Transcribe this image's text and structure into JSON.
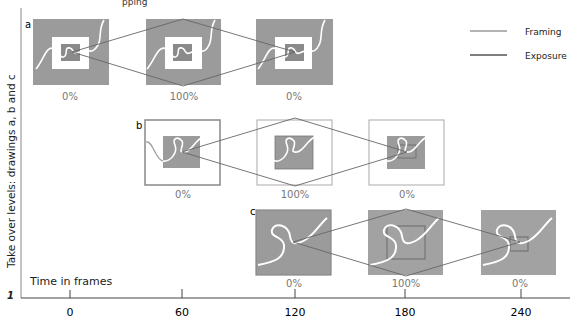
{
  "caption_fragment": "pping",
  "corner_mark": "1",
  "y_axis_label": "Take over levels: drawings a, b and c",
  "x_axis_label": "Time in frames",
  "x_ticks": [
    "0",
    "60",
    "120",
    "180",
    "240"
  ],
  "legend": {
    "framing": "Framing",
    "exposure": "Exposure"
  },
  "rows": [
    {
      "letter": "a",
      "percents": [
        "0%",
        "100%",
        "0%"
      ]
    },
    {
      "letter": "b",
      "percents": [
        "0%",
        "100%",
        "0%"
      ]
    },
    {
      "letter": "c",
      "percents": [
        "0%",
        "100%",
        "0%"
      ]
    }
  ],
  "colors": {
    "framing": "#9a9a9a",
    "exposure": "#6a6a6a",
    "frame_fill": "#9b9b9b",
    "axis": "#444444"
  }
}
